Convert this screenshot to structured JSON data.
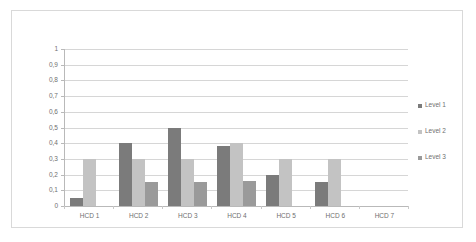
{
  "chart_data": {
    "type": "bar",
    "title": "",
    "subtitle": "",
    "xlabel": "",
    "ylabel": "",
    "categories": [
      "HCD 1",
      "HCD 2",
      "HCD 3",
      "HCD 4",
      "HCD 5",
      "HCD 6",
      "HCD 7"
    ],
    "series": [
      {
        "name": "Level 1",
        "color": "#7b7b7b",
        "values": [
          0.05,
          0.4,
          0.5,
          0.38,
          0.2,
          0.15,
          0
        ]
      },
      {
        "name": "Level 2",
        "color": "#c3c3c3",
        "values": [
          0.3,
          0.3,
          0.3,
          0.4,
          0.3,
          0.3,
          0
        ]
      },
      {
        "name": "Level 3",
        "color": "#9a9a9a",
        "values": [
          0,
          0.15,
          0.15,
          0.16,
          0,
          0,
          0
        ]
      }
    ],
    "ylim": [
      0,
      1
    ],
    "ytick_values": [
      0,
      0.1,
      0.2,
      0.3,
      0.4,
      0.5,
      0.6,
      0.7,
      0.8,
      0.9,
      1
    ],
    "ytick_labels": [
      "0",
      "0,1",
      "0,2",
      "0,3",
      "0,4",
      "0,5",
      "0,6",
      "0,7",
      "0,8",
      "0,9",
      "1"
    ],
    "grid": true,
    "legend_position": "right",
    "decimal_separator": ",",
    "axis_color": "#b9b9b9",
    "grid_color": "#d6d6d6",
    "text_color": "#6f6f6f",
    "frame_color": "#d9d9d9",
    "background": "#ffffff"
  }
}
